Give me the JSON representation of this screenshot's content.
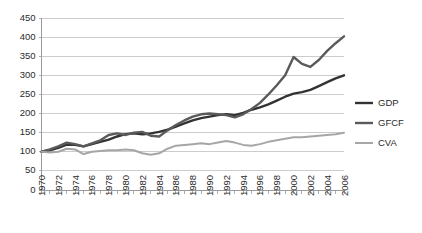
{
  "chart_data": {
    "type": "line",
    "title": "",
    "xlabel": "",
    "ylabel": "",
    "ylim": [
      0,
      450
    ],
    "ytick_step": 50,
    "ytick_labels": [
      "0",
      "50",
      "100",
      "150",
      "200",
      "250",
      "300",
      "350",
      "400",
      "450"
    ],
    "grid": true,
    "legend_position": "right",
    "x": [
      1970,
      1971,
      1972,
      1973,
      1974,
      1975,
      1976,
      1977,
      1978,
      1979,
      1980,
      1981,
      1982,
      1983,
      1984,
      1985,
      1986,
      1987,
      1988,
      1989,
      1990,
      1991,
      1992,
      1993,
      1994,
      1995,
      1996,
      1997,
      1998,
      1999,
      2000,
      2001,
      2002,
      2003,
      2004,
      2005,
      2006
    ],
    "xtick_labels": [
      "1970",
      "1972",
      "1974",
      "1976",
      "1978",
      "1980",
      "1982",
      "1984",
      "1986",
      "1988",
      "1990",
      "1992",
      "1994",
      "1996",
      "1998",
      "2000",
      "2002",
      "2004",
      "2006"
    ],
    "xtick_label_step": 2,
    "series": [
      {
        "name": "GDP",
        "color": "#333333",
        "width": 2.4,
        "values": [
          100,
          104,
          110,
          119,
          118,
          114,
          120,
          126,
          132,
          140,
          146,
          148,
          146,
          148,
          152,
          158,
          166,
          174,
          182,
          188,
          192,
          196,
          198,
          196,
          202,
          210,
          216,
          224,
          234,
          244,
          252,
          256,
          262,
          272,
          282,
          292,
          300
        ]
      },
      {
        "name": "GFCF",
        "color": "#5a5a5a",
        "width": 2.4,
        "values": [
          100,
          106,
          114,
          124,
          120,
          114,
          122,
          130,
          144,
          148,
          144,
          150,
          152,
          142,
          140,
          156,
          170,
          182,
          192,
          198,
          200,
          198,
          196,
          190,
          198,
          212,
          228,
          250,
          274,
          300,
          348,
          330,
          322,
          340,
          364,
          384,
          402
        ]
      },
      {
        "name": "CVA",
        "color": "#a6a6a6",
        "width": 2.0,
        "values": [
          100,
          98,
          100,
          108,
          106,
          94,
          100,
          102,
          104,
          104,
          106,
          104,
          96,
          92,
          96,
          108,
          116,
          118,
          120,
          122,
          120,
          124,
          128,
          124,
          118,
          116,
          120,
          126,
          130,
          134,
          138,
          138,
          140,
          142,
          144,
          146,
          150
        ]
      }
    ]
  },
  "legend": {
    "items": [
      {
        "label": "GDP"
      },
      {
        "label": "GFCF"
      },
      {
        "label": "CVA"
      }
    ]
  }
}
